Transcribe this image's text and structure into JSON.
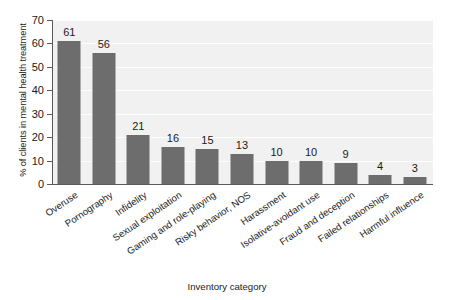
{
  "chart_data": {
    "type": "bar",
    "title": "",
    "xlabel": "Inventory category",
    "ylabel": "% of clients in mental health treatment",
    "categories": [
      "Overuse",
      "Pornography",
      "Infidelity",
      "Sexual exploitation",
      "Gaming and role-playing",
      "Risky behavior, NOS",
      "Harassment",
      "Isolative-avoidant use",
      "Fraud and deception",
      "Failed relationships",
      "Harmful influence"
    ],
    "values": [
      61,
      56,
      21,
      16,
      15,
      13,
      10,
      10,
      9,
      4,
      3
    ],
    "ylim": [
      0,
      70
    ],
    "yticks": [
      0,
      10,
      20,
      30,
      40,
      50,
      60,
      70
    ],
    "ytick_labels": [
      "0",
      "10",
      "20",
      "30",
      "40",
      "50",
      "60",
      "70"
    ],
    "value_labels": [
      "61",
      "56",
      "21",
      "16",
      "15",
      "13",
      "10",
      "10",
      "9",
      "4",
      "3"
    ],
    "grid": true,
    "legend": "none",
    "bar_color": "#6d6d6d",
    "plot_background": "#f1f1f1",
    "gridline_color": "#fdfdfd",
    "axis_color": "#5a5a5a",
    "text_color": "#1a1a1a"
  }
}
